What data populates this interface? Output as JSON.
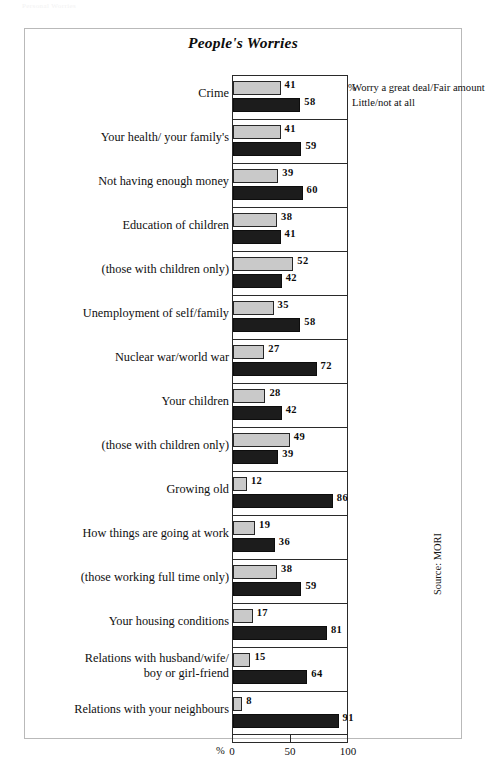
{
  "page": {
    "faint_header": "Personal Worries"
  },
  "figure": {
    "title": "People's Worries",
    "source_note": "Source: MORI",
    "axis_unit": "%",
    "legend": {
      "percent_symbol": "%",
      "series": [
        {
          "label": "Worry a great deal/Fair amount",
          "color": "#c9c9c9"
        },
        {
          "label": "Little/not at all",
          "color": "#1c1c1c"
        }
      ]
    }
  },
  "chart_data": {
    "type": "bar",
    "orientation": "horizontal",
    "title": "People's Worries",
    "xlabel": "%",
    "ylabel": "",
    "xlim": [
      0,
      100
    ],
    "xticks": [
      0,
      50,
      100
    ],
    "xtick_labels": [
      "0",
      "50",
      "100"
    ],
    "grid": false,
    "legend_position": "top-right",
    "source": "Source: MORI",
    "categories": [
      "Crime",
      "Your health/ your family's",
      "Not having enough money",
      "Education of children",
      "(those with children only)",
      "Unemployment of self/family",
      "Nuclear war/world war",
      "Your children",
      "(those with children only)",
      "Growing old",
      "How things are going at work",
      "(those working full time only)",
      "Your housing conditions",
      "Relations with husband/wife/ boy or girl-friend",
      "Relations with your neighbours"
    ],
    "series": [
      {
        "name": "Worry a great deal/Fair amount",
        "color": "#c9c9c9",
        "values": [
          41,
          41,
          39,
          38,
          52,
          35,
          27,
          28,
          49,
          12,
          19,
          38,
          17,
          15,
          8
        ]
      },
      {
        "name": "Little/not at all",
        "color": "#1c1c1c",
        "values": [
          58,
          59,
          60,
          41,
          42,
          58,
          72,
          42,
          39,
          86,
          36,
          59,
          81,
          64,
          91
        ]
      }
    ]
  },
  "rows": [
    {
      "label": "Crime",
      "label_line2": "",
      "light": 41,
      "dark": 58
    },
    {
      "label": "Your health/ your family's",
      "label_line2": "",
      "light": 41,
      "dark": 59
    },
    {
      "label": "Not having enough money",
      "label_line2": "",
      "light": 39,
      "dark": 60
    },
    {
      "label": "Education of children",
      "label_line2": "",
      "light": 38,
      "dark": 41
    },
    {
      "label": "(those with children only)",
      "label_line2": "",
      "light": 52,
      "dark": 42
    },
    {
      "label": "Unemployment of self/family",
      "label_line2": "",
      "light": 35,
      "dark": 58
    },
    {
      "label": "Nuclear war/world war",
      "label_line2": "",
      "light": 27,
      "dark": 72
    },
    {
      "label": "Your children",
      "label_line2": "",
      "light": 28,
      "dark": 42
    },
    {
      "label": "(those with children only)",
      "label_line2": "",
      "light": 49,
      "dark": 39
    },
    {
      "label": "Growing old",
      "label_line2": "",
      "light": 12,
      "dark": 86
    },
    {
      "label": "How things are going at work",
      "label_line2": "",
      "light": 19,
      "dark": 36
    },
    {
      "label": "(those working full time only)",
      "label_line2": "",
      "light": 38,
      "dark": 59
    },
    {
      "label": "Your housing conditions",
      "label_line2": "",
      "light": 17,
      "dark": 81
    },
    {
      "label": "Relations with husband/wife/",
      "label_line2": "boy or girl-friend",
      "light": 15,
      "dark": 64
    },
    {
      "label": "Relations with your neighbours",
      "label_line2": "",
      "light": 8,
      "dark": 91
    }
  ]
}
